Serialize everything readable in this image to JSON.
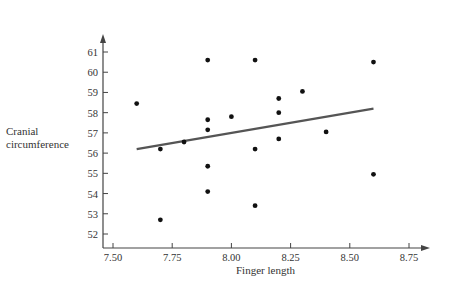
{
  "chart_data": {
    "type": "scatter",
    "title": "",
    "xlabel": "Finger length",
    "ylabel_lines": [
      "Cranial",
      "circumference"
    ],
    "ylabel": "Cranial circumference",
    "x_ticks": [
      "7.50",
      "7.75",
      "8.00",
      "8.25",
      "8.50",
      "8.75"
    ],
    "y_ticks": [
      "52",
      "53",
      "54",
      "55",
      "56",
      "57",
      "58",
      "59",
      "60",
      "61"
    ],
    "xlim": [
      7.46,
      8.8
    ],
    "ylim": [
      51.3,
      61.8
    ],
    "grid": false,
    "legend": "none",
    "points": [
      {
        "x": 7.6,
        "y": 58.45
      },
      {
        "x": 7.7,
        "y": 56.2
      },
      {
        "x": 7.7,
        "y": 52.7
      },
      {
        "x": 7.8,
        "y": 56.55
      },
      {
        "x": 7.9,
        "y": 60.6
      },
      {
        "x": 7.9,
        "y": 57.65
      },
      {
        "x": 7.9,
        "y": 57.15
      },
      {
        "x": 7.9,
        "y": 55.35
      },
      {
        "x": 7.9,
        "y": 54.1
      },
      {
        "x": 8.0,
        "y": 57.8
      },
      {
        "x": 8.1,
        "y": 60.6
      },
      {
        "x": 8.1,
        "y": 56.2
      },
      {
        "x": 8.1,
        "y": 53.4
      },
      {
        "x": 8.2,
        "y": 58.7
      },
      {
        "x": 8.2,
        "y": 58.0
      },
      {
        "x": 8.2,
        "y": 56.7
      },
      {
        "x": 8.3,
        "y": 59.05
      },
      {
        "x": 8.4,
        "y": 57.05
      },
      {
        "x": 8.6,
        "y": 60.5
      },
      {
        "x": 8.6,
        "y": 54.95
      }
    ],
    "regression_line": {
      "x": [
        7.6,
        8.6
      ],
      "y": [
        56.2,
        58.2
      ]
    }
  }
}
